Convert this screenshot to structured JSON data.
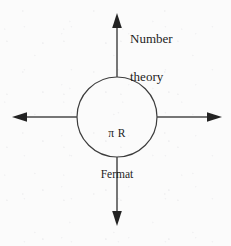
{
  "figure": {
    "kind": "radial-node-diagram",
    "background_color": "#fbfbfb",
    "stroke_color": "#3c3c3c",
    "text_color": "#1d1d1d",
    "node": {
      "shape": "circle",
      "center_x": 117,
      "center_y": 117,
      "radius": 40,
      "line_1": "π R",
      "line_2": "Fermat"
    },
    "arrows": [
      {
        "name": "arrow-up",
        "direction": "up",
        "label": "Number theory"
      },
      {
        "name": "arrow-right",
        "direction": "right",
        "label": ""
      },
      {
        "name": "arrow-down",
        "direction": "down",
        "label": ""
      },
      {
        "name": "arrow-left",
        "direction": "left",
        "label": ""
      }
    ],
    "labels": {
      "north_line_1": "Number",
      "north_line_2": "theory"
    }
  }
}
